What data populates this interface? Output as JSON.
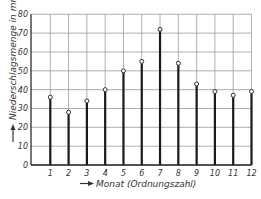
{
  "chart_data": {
    "type": "bar",
    "style": "stem",
    "title": "",
    "xlabel": "Monat (Ordnungszahl)",
    "ylabel": "Niederschlagsmenge in mm",
    "categories": [
      "1",
      "2",
      "3",
      "4",
      "5",
      "6",
      "7",
      "8",
      "9",
      "10",
      "11",
      "12"
    ],
    "values": [
      36,
      28,
      34,
      40,
      50,
      55,
      72,
      54,
      43,
      39,
      37,
      39
    ],
    "ylim": [
      0,
      80
    ],
    "yticks": [
      0,
      10,
      20,
      30,
      40,
      50,
      60,
      70,
      80
    ],
    "grid": true,
    "legend": null,
    "marker": "open-circle"
  },
  "colors": {
    "grid": "#9a9a9a",
    "stem": "#1a1a1a",
    "text": "#333333",
    "background": "#ffffff"
  },
  "axis": {
    "x_arrow": "→",
    "y_arrow": "↑"
  }
}
